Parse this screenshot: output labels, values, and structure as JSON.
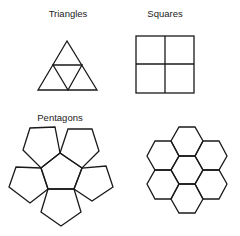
{
  "panels": [
    {
      "label": "Triangles",
      "shape": "triangle"
    },
    {
      "label": "Squares",
      "shape": "square"
    },
    {
      "label": "Pentagons",
      "shape": "pentagon"
    },
    {
      "label": "",
      "shape": "hexagon"
    }
  ],
  "colors": {
    "stroke": "#1a1a1a",
    "background": "#ffffff"
  }
}
